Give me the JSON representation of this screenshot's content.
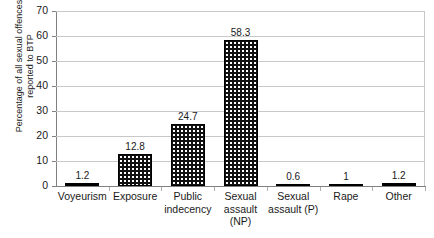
{
  "chart_data": {
    "type": "bar",
    "title": "",
    "xlabel": "",
    "ylabel": "Percentage of all sexual offences\nreported to BTP",
    "categories": [
      "Voyeurism",
      "Exposure",
      "Public indecency",
      "Sexual assault (NP)",
      "Sexual assault (P)",
      "Rape",
      "Other"
    ],
    "category_lines": [
      [
        "Voyeurism"
      ],
      [
        "Exposure"
      ],
      [
        "Public",
        "indecency"
      ],
      [
        "Sexual",
        "assault",
        "(NP)"
      ],
      [
        "Sexual",
        "assault (P)"
      ],
      [
        "Rape"
      ],
      [
        "Other"
      ]
    ],
    "values": [
      1.2,
      12.8,
      24.7,
      58.3,
      0.6,
      1,
      1.2
    ],
    "value_labels": [
      "1.2",
      "12.8",
      "24.7",
      "58.3",
      "0.6",
      "1",
      "1.2"
    ],
    "ylim": [
      0,
      70
    ],
    "ytick_values": [
      0,
      10,
      20,
      30,
      40,
      50,
      60,
      70
    ],
    "ytick_labels": [
      "0",
      "10",
      "20",
      "30",
      "40",
      "50",
      "60",
      "70"
    ],
    "grid": true,
    "legend": false,
    "bar_fill": "#111111",
    "bar_pattern": "white-dots-on-black",
    "gridline_color": "#c8c8c8",
    "axis_color": "#808080",
    "background": "#ffffff"
  }
}
